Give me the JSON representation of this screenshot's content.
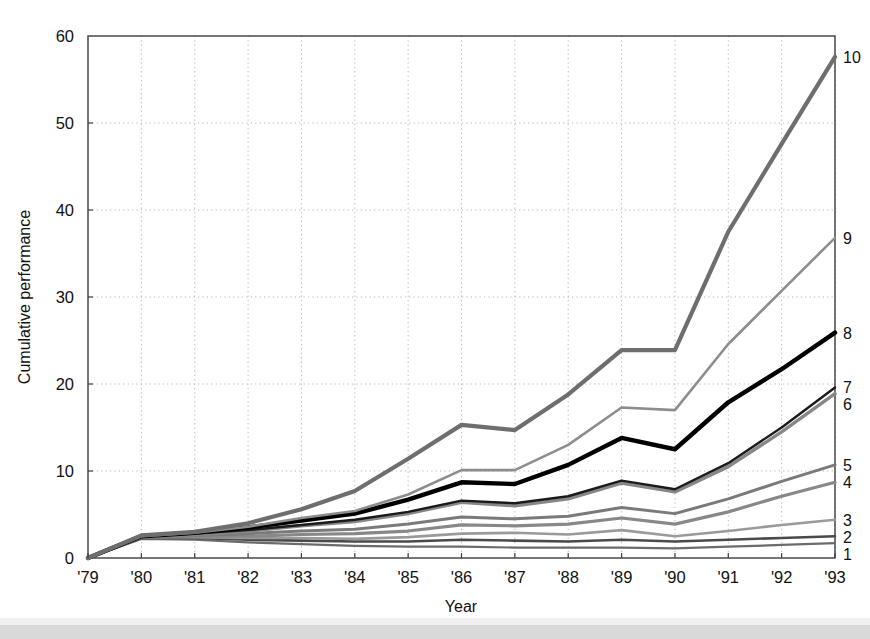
{
  "chart_data": {
    "type": "line",
    "title": "",
    "xlabel": "Year",
    "ylabel": "Cumulative performance",
    "x": [
      "'79",
      "'80",
      "'81",
      "'82",
      "'83",
      "'84",
      "'85",
      "'86",
      "'87",
      "'88",
      "'89",
      "'90",
      "'91",
      "'92",
      "'93"
    ],
    "xlim": [
      0,
      14
    ],
    "ylim": [
      0,
      60
    ],
    "yticks": [
      0,
      10,
      20,
      30,
      40,
      50,
      60
    ],
    "ytick_labels": [
      "0",
      "10",
      "20",
      "30",
      "40",
      "50",
      "60"
    ],
    "grid": true,
    "grid_style": "dotted",
    "legend_position": "right-edge-inline",
    "series": [
      {
        "name": "1",
        "label": "1",
        "color": "#6b6b6b",
        "width": 2.2,
        "values": [
          0,
          2.2,
          2.1,
          1.8,
          1.6,
          1.4,
          1.3,
          1.3,
          1.2,
          1.2,
          1.2,
          1.1,
          1.3,
          1.5,
          1.7
        ]
      },
      {
        "name": "2",
        "label": "2",
        "color": "#4a4a4a",
        "width": 2.6,
        "values": [
          0,
          2.3,
          2.3,
          2.1,
          2.0,
          1.9,
          1.9,
          2.1,
          2.0,
          1.9,
          2.1,
          1.9,
          2.1,
          2.3,
          2.5
        ]
      },
      {
        "name": "3",
        "label": "3",
        "color": "#9a9a9a",
        "width": 2.6,
        "values": [
          0,
          2.4,
          2.4,
          2.3,
          2.3,
          2.2,
          2.4,
          2.8,
          2.9,
          2.7,
          3.2,
          2.5,
          3.1,
          3.8,
          4.4
        ]
      },
      {
        "name": "4",
        "label": "4",
        "color": "#888888",
        "width": 3.2,
        "values": [
          0,
          2.4,
          2.5,
          2.5,
          2.7,
          2.8,
          3.1,
          3.8,
          3.7,
          3.9,
          4.6,
          3.9,
          5.3,
          7.1,
          8.7
        ]
      },
      {
        "name": "5",
        "label": "5",
        "color": "#7a7a7a",
        "width": 3.0,
        "values": [
          0,
          2.4,
          2.6,
          2.8,
          3.1,
          3.3,
          3.9,
          4.7,
          4.5,
          4.8,
          5.8,
          5.1,
          6.8,
          8.8,
          10.7
        ]
      },
      {
        "name": "6",
        "label": "6",
        "color": "#878787",
        "width": 3.4,
        "values": [
          0,
          2.5,
          2.7,
          3.1,
          3.7,
          4.2,
          5.1,
          6.4,
          6.0,
          6.8,
          8.6,
          7.6,
          10.5,
          14.5,
          18.9
        ]
      },
      {
        "name": "7",
        "label": "7",
        "color": "#1a1a1a",
        "width": 2.4,
        "values": [
          0,
          2.5,
          2.8,
          3.2,
          3.8,
          4.4,
          5.3,
          6.6,
          6.3,
          7.1,
          8.9,
          7.9,
          10.9,
          15.0,
          19.6
        ]
      },
      {
        "name": "8",
        "label": "8",
        "color": "#000000",
        "width": 4.4,
        "values": [
          0,
          2.5,
          2.9,
          3.5,
          4.3,
          5.1,
          6.7,
          8.7,
          8.5,
          10.7,
          13.8,
          12.5,
          17.9,
          21.7,
          25.9
        ]
      },
      {
        "name": "9",
        "label": "9",
        "color": "#8d8d8d",
        "width": 2.6,
        "values": [
          0,
          2.5,
          2.9,
          3.6,
          4.6,
          5.4,
          7.3,
          10.1,
          10.1,
          13.0,
          17.3,
          17.0,
          24.6,
          30.7,
          36.8
        ]
      },
      {
        "name": "10",
        "label": "10",
        "color": "#6e6e6e",
        "width": 4.2,
        "values": [
          0,
          2.6,
          3.0,
          4.0,
          5.6,
          7.7,
          11.4,
          15.3,
          14.7,
          18.8,
          23.9,
          23.9,
          37.5,
          47.6,
          57.6
        ]
      }
    ]
  },
  "figure": {
    "xlabel": "Year",
    "ylabel": "Cumulative performance"
  }
}
